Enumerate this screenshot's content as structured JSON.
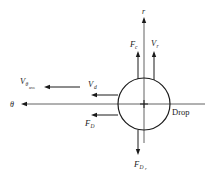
{
  "diagram": {
    "axes": {
      "radial_label": "r",
      "tangential_label": "θ"
    },
    "object_label": "Drop",
    "vectors": [
      {
        "id": "Fc",
        "symbol": "F",
        "subscript": "c",
        "direction": "up",
        "meaning": "centrifugal force"
      },
      {
        "id": "Vr",
        "symbol": "V",
        "subscript": "r",
        "direction": "up",
        "meaning": "radial velocity"
      },
      {
        "id": "Vd",
        "symbol": "V",
        "subscript": "d",
        "direction": "left",
        "meaning": "drop velocity"
      },
      {
        "id": "FD",
        "symbol": "F",
        "subscript": "D",
        "direction": "left",
        "meaning": "drag force"
      },
      {
        "id": "Vtheta_ave",
        "symbol": "V",
        "subscript": "θ",
        "subsub": "ave",
        "direction": "left",
        "meaning": "average tangential gas velocity"
      },
      {
        "id": "FDr",
        "symbol": "F",
        "subscript": "D",
        "subsub": "r",
        "direction": "down",
        "meaning": "radial drag force"
      }
    ]
  }
}
